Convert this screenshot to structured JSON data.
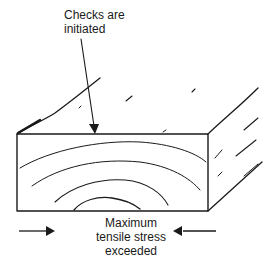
{
  "diagram": {
    "title_annotation": {
      "lines": [
        "Checks are",
        "initiated"
      ]
    },
    "bottom_annotation": {
      "lines": [
        "Maximum",
        "tensile stress",
        "exceeded"
      ]
    },
    "elements": {
      "block": "timber-block-end-grain",
      "growth_rings": 4,
      "pointer_arrow": "arrow-down-to-top-edge",
      "force_arrows": [
        "arrow-right-left-side",
        "arrow-left-right-side"
      ]
    },
    "colors": {
      "ink": "#1a1a1a",
      "background": "#ffffff"
    }
  }
}
